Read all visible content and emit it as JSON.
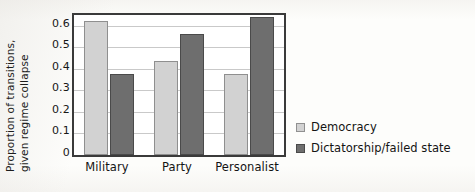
{
  "chart_data": {
    "type": "bar",
    "title": "",
    "xlabel": "",
    "ylabel": "Proportion of transitions, given regime collapse",
    "ylabel_line1": "Proportion of transitions,",
    "ylabel_line2": "given regime collapse",
    "categories": [
      "Military",
      "Party",
      "Personalist"
    ],
    "series": [
      {
        "name": "Democracy",
        "color": "#d2d2d2",
        "values": [
          0.62,
          0.435,
          0.375
        ]
      },
      {
        "name": "Dictatorship/failed state",
        "color": "#6e6e6e",
        "values": [
          0.375,
          0.56,
          0.64
        ]
      }
    ],
    "ylim": [
      0,
      0.65
    ],
    "ytick_values": [
      0,
      0.1,
      0.2,
      0.3,
      0.4,
      0.5,
      0.6
    ],
    "ytick_labels": [
      "0",
      "0.1",
      "0.2",
      "0.3",
      "0.4",
      "0.5",
      "0.6"
    ],
    "grid": true,
    "grid_axis": "y",
    "legend_position": "right",
    "frame": true
  },
  "legend": {
    "entries": [
      {
        "label": "Democracy",
        "swatch": "light-gray-square"
      },
      {
        "label": "Dictatorship/failed state",
        "swatch": "dark-gray-square"
      }
    ]
  },
  "colors": {
    "democracy": "#d2d2d2",
    "dictatorship": "#6e6e6e",
    "frame": "#3a3a3a",
    "gridline": "#c9c9c9",
    "text": "#141414",
    "background": "#fdfdfb"
  }
}
